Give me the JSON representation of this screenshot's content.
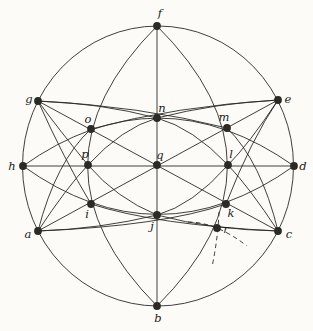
{
  "figure": {
    "description_label": "incidence-geometry-diagram",
    "background": "#fcfbf8",
    "stroke": "#2b2a26",
    "label_color": "#1d1c19",
    "stroke_width": 0.9,
    "dot_radius": 3.9,
    "dash_pattern": "4.5,3.5",
    "circle": {
      "cx": 158,
      "cy": 166,
      "rx": 135.5,
      "ry": 140
    },
    "points": [
      {
        "label": "f",
        "x": 157,
        "y": 26,
        "lx": 160,
        "ly": 17
      },
      {
        "label": "g",
        "x": 38,
        "y": 101,
        "lx": 29,
        "ly": 103
      },
      {
        "label": "e",
        "x": 278,
        "y": 100,
        "lx": 288,
        "ly": 103
      },
      {
        "label": "h",
        "x": 23,
        "y": 166,
        "lx": 12,
        "ly": 170
      },
      {
        "label": "d",
        "x": 294,
        "y": 166,
        "lx": 303,
        "ly": 170
      },
      {
        "label": "a",
        "x": 38,
        "y": 231,
        "lx": 28,
        "ly": 238
      },
      {
        "label": "c",
        "x": 278,
        "y": 231,
        "lx": 289,
        "ly": 238
      },
      {
        "label": "b",
        "x": 157,
        "y": 306,
        "lx": 158,
        "ly": 322
      },
      {
        "label": "n",
        "x": 157,
        "y": 118,
        "lx": 162,
        "ly": 112
      },
      {
        "label": "o",
        "x": 91,
        "y": 129,
        "lx": 88,
        "ly": 123
      },
      {
        "label": "m",
        "x": 227,
        "y": 128,
        "lx": 224,
        "ly": 121
      },
      {
        "label": "p",
        "x": 88,
        "y": 165,
        "lx": 85,
        "ly": 158
      },
      {
        "label": "q",
        "x": 157,
        "y": 165,
        "lx": 160,
        "ly": 159
      },
      {
        "label": "l",
        "x": 228,
        "y": 165,
        "lx": 231,
        "ly": 158
      },
      {
        "label": "i",
        "x": 91,
        "y": 204,
        "lx": 87,
        "ly": 218
      },
      {
        "label": "j",
        "x": 157,
        "y": 215,
        "lx": 152,
        "ly": 230
      },
      {
        "label": "k",
        "x": 226,
        "y": 204,
        "lx": 231,
        "ly": 217
      },
      {
        "label": "r",
        "x": 217,
        "y": 228,
        "lx": 226,
        "ly": 233
      }
    ],
    "solid_curves": [
      {
        "name": "line-f-n-q-j-b",
        "d": "M157,26 L157,306"
      },
      {
        "name": "line-h-p-q-l-d",
        "d": "M23,166 L294,166"
      },
      {
        "name": "line-g-o-q-k-c",
        "d": "M38,101 L278,231"
      },
      {
        "name": "line-e-m-q-i-a",
        "d": "M278,100 L38,231"
      },
      {
        "name": "arc-h-o-n-m-d",
        "d": "M23,166 Q158,70 294,166"
      },
      {
        "name": "arc-h-i-j-k-d",
        "d": "M23,166 Q158,263 294,166"
      },
      {
        "name": "arc-f-o-p-i-b",
        "d": "M157,26 Q18,166 157,306"
      },
      {
        "name": "arc-f-m-l-k-b",
        "d": "M157,26 Q298,166 157,306"
      },
      {
        "name": "curve-g-n-l-c",
        "d": "M38,101 Q100,103 157,118 Q193,128 228,165 Q249,187 278,231"
      },
      {
        "name": "curve-e-n-p-a",
        "d": "M278,100 Q216,103 157,118 Q122,128 88,165 Q67,187 38,231"
      },
      {
        "name": "curve-g-p-j-c",
        "d": "M38,101 Q60,131 88,165 Q116,198 157,215 Q213,230 278,231"
      },
      {
        "name": "curve-a-j-l-e",
        "d": "M38,231 Q100,229 157,215 Q193,205 228,165 Q249,144 278,100"
      },
      {
        "name": "curve-g-m-c",
        "d": "M38,101 Q140,106 227,128 Q261,161 278,231"
      },
      {
        "name": "curve-e-o-a",
        "d": "M278,100 Q176,106 91,129 Q56,161 38,231"
      },
      {
        "name": "curve-e-k-a",
        "d": "M278,100 Q251,140 226,204 Q162,226 38,231"
      },
      {
        "name": "curve-g-i-c",
        "d": "M38,101 Q64,159 91,204 Q156,225 278,231"
      }
    ],
    "dashed_curves": [
      {
        "name": "through-r-shallow",
        "d": "M188,222 Q216,222 247,246"
      },
      {
        "name": "through-r-steep",
        "d": "M219,212 Q218,238 212,267"
      }
    ]
  }
}
